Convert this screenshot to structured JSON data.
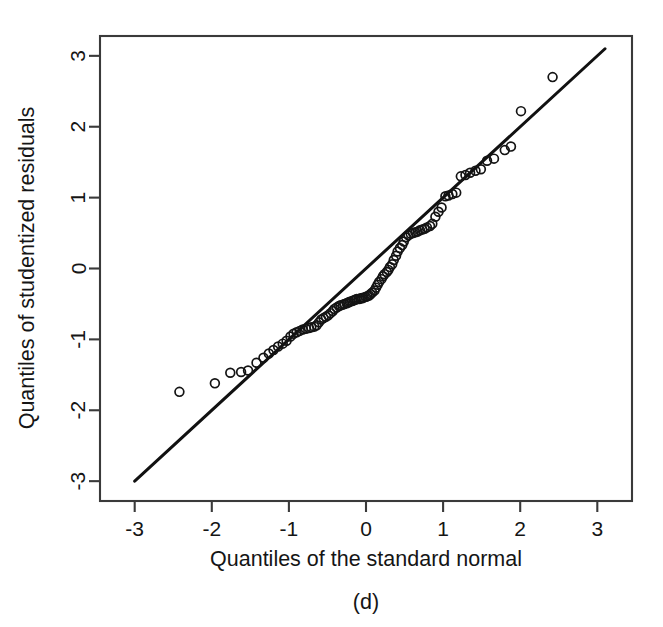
{
  "figure": {
    "caption": "(d)",
    "background": "#ffffff",
    "foreground": "#151515"
  },
  "chart_data": {
    "type": "scatter",
    "title": "",
    "subtitle": "",
    "xlabel": "Quantiles of the standard normal",
    "ylabel": "Quantiles of studentized residuals",
    "xlim": [
      -3.45,
      3.45
    ],
    "ylim": [
      -3.28,
      3.28
    ],
    "xticks": [
      -3,
      -2,
      -1,
      0,
      1,
      2,
      3
    ],
    "yticks": [
      -3,
      -2,
      -1,
      0,
      1,
      2,
      3
    ],
    "xticklabels": [
      "-3",
      "-2",
      "-1",
      "0",
      "1",
      "2",
      "3"
    ],
    "yticklabels": [
      "-3",
      "-2",
      "-1",
      "0",
      "1",
      "2",
      "3"
    ],
    "grid": false,
    "legend": null,
    "legend_position": "none",
    "marker": "open-circle",
    "marker_size": 4.4,
    "point_color": "#141414",
    "line_color": "#111111",
    "reference_line": {
      "label": "identity line",
      "x": [
        -3.0,
        3.1
      ],
      "y": [
        -3.0,
        3.1
      ],
      "slope": 1.0,
      "intercept": 0.0
    },
    "n_points": 96,
    "annotations": [],
    "points": [
      [
        -2.42,
        -1.74
      ],
      [
        -1.96,
        -1.62
      ],
      [
        -1.76,
        -1.47
      ],
      [
        -1.62,
        -1.46
      ],
      [
        -1.53,
        -1.44
      ],
      [
        -1.42,
        -1.33
      ],
      [
        -1.33,
        -1.26
      ],
      [
        -1.26,
        -1.2
      ],
      [
        -1.2,
        -1.15
      ],
      [
        -1.14,
        -1.1
      ],
      [
        -1.08,
        -1.06
      ],
      [
        -1.03,
        -1.02
      ],
      [
        -0.98,
        -0.96
      ],
      [
        -0.94,
        -0.92
      ],
      [
        -0.9,
        -0.9
      ],
      [
        -0.86,
        -0.88
      ],
      [
        -0.82,
        -0.86
      ],
      [
        -0.78,
        -0.85
      ],
      [
        -0.74,
        -0.84
      ],
      [
        -0.71,
        -0.83
      ],
      [
        -0.67,
        -0.82
      ],
      [
        -0.64,
        -0.8
      ],
      [
        -0.61,
        -0.76
      ],
      [
        -0.58,
        -0.72
      ],
      [
        -0.55,
        -0.7
      ],
      [
        -0.52,
        -0.68
      ],
      [
        -0.49,
        -0.66
      ],
      [
        -0.46,
        -0.63
      ],
      [
        -0.43,
        -0.6
      ],
      [
        -0.41,
        -0.57
      ],
      [
        -0.38,
        -0.55
      ],
      [
        -0.35,
        -0.53
      ],
      [
        -0.33,
        -0.52
      ],
      [
        -0.3,
        -0.51
      ],
      [
        -0.28,
        -0.5
      ],
      [
        -0.25,
        -0.49
      ],
      [
        -0.23,
        -0.48
      ],
      [
        -0.21,
        -0.47
      ],
      [
        -0.18,
        -0.46
      ],
      [
        -0.16,
        -0.45
      ],
      [
        -0.14,
        -0.44
      ],
      [
        -0.12,
        -0.43
      ],
      [
        -0.09,
        -0.43
      ],
      [
        -0.07,
        -0.42
      ],
      [
        -0.05,
        -0.42
      ],
      [
        -0.03,
        -0.41
      ],
      [
        0.0,
        -0.4
      ],
      [
        0.02,
        -0.39
      ],
      [
        0.04,
        -0.38
      ],
      [
        0.06,
        -0.36
      ],
      [
        0.08,
        -0.34
      ],
      [
        0.11,
        -0.31
      ],
      [
        0.13,
        -0.27
      ],
      [
        0.15,
        -0.23
      ],
      [
        0.17,
        -0.19
      ],
      [
        0.2,
        -0.15
      ],
      [
        0.22,
        -0.11
      ],
      [
        0.24,
        -0.08
      ],
      [
        0.27,
        -0.05
      ],
      [
        0.29,
        -0.02
      ],
      [
        0.31,
        0.02
      ],
      [
        0.34,
        0.06
      ],
      [
        0.36,
        0.12
      ],
      [
        0.39,
        0.18
      ],
      [
        0.41,
        0.24
      ],
      [
        0.44,
        0.29
      ],
      [
        0.47,
        0.33
      ],
      [
        0.49,
        0.38
      ],
      [
        0.52,
        0.44
      ],
      [
        0.55,
        0.47
      ],
      [
        0.58,
        0.49
      ],
      [
        0.61,
        0.5
      ],
      [
        0.64,
        0.51
      ],
      [
        0.67,
        0.52
      ],
      [
        0.7,
        0.54
      ],
      [
        0.73,
        0.55
      ],
      [
        0.76,
        0.56
      ],
      [
        0.79,
        0.58
      ],
      [
        0.83,
        0.6
      ],
      [
        0.86,
        0.63
      ],
      [
        0.9,
        0.73
      ],
      [
        0.94,
        0.8
      ],
      [
        0.98,
        0.86
      ],
      [
        1.03,
        1.02
      ],
      [
        1.07,
        1.03
      ],
      [
        1.12,
        1.05
      ],
      [
        1.17,
        1.07
      ],
      [
        1.23,
        1.3
      ],
      [
        1.29,
        1.32
      ],
      [
        1.35,
        1.35
      ],
      [
        1.42,
        1.38
      ],
      [
        1.49,
        1.4
      ],
      [
        1.57,
        1.52
      ],
      [
        1.66,
        1.55
      ],
      [
        1.8,
        1.67
      ],
      [
        1.88,
        1.72
      ],
      [
        2.01,
        2.22
      ],
      [
        2.42,
        2.7
      ]
    ]
  }
}
